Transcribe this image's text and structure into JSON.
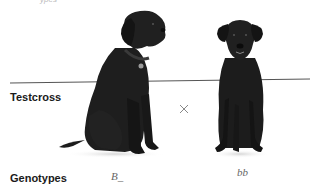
{
  "figure": {
    "top_fragment": "ypes",
    "rows": {
      "testcross_label": "Testcross",
      "genotypes_label": "Genotypes"
    },
    "cross_symbol": "×",
    "parents": [
      {
        "name": "black-lab-sitting-angled",
        "coat_color": "#1c1c1c",
        "genotype": "B_"
      },
      {
        "name": "black-lab-sitting-front",
        "coat_color": "#1c1c1c",
        "genotype": "bb"
      }
    ],
    "colors": {
      "divider": "#555555",
      "label": "#1a1a1a",
      "genotype_text": "#666666",
      "cross": "#888888"
    }
  }
}
